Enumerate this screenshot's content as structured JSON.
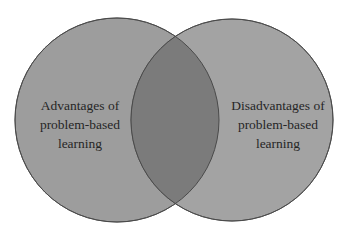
{
  "diagram": {
    "type": "venn",
    "sets": [
      {
        "id": "left",
        "lines": [
          "Advantages of",
          "problem-based",
          "learning"
        ],
        "fill": "#9e9e9e"
      },
      {
        "id": "right",
        "lines": [
          "Disadvantages of",
          "problem-based",
          "learning"
        ],
        "fill": "#a4a4a4"
      }
    ],
    "intersection": {
      "label": "",
      "fill": "#7a7a7a"
    },
    "stroke": "#555555"
  }
}
